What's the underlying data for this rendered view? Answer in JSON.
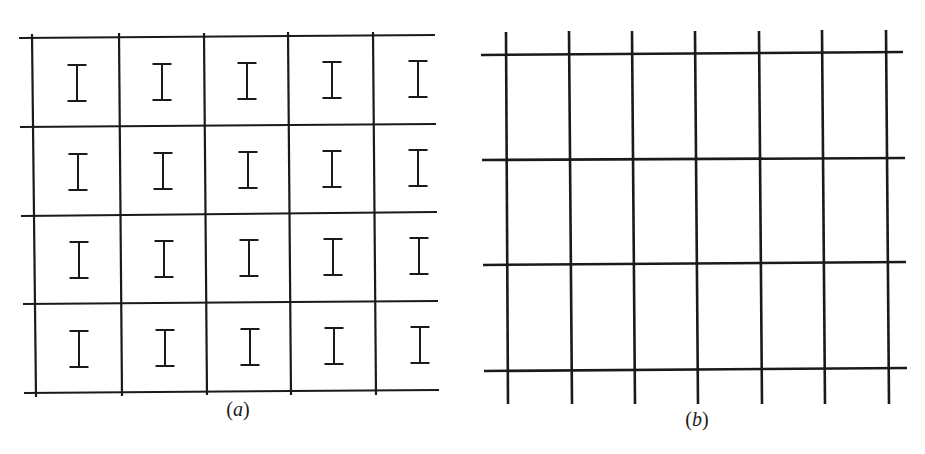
{
  "figure": {
    "line_color": "#1a1a1a",
    "panels": [
      {
        "id": "a",
        "caption": "(a)",
        "caption_letter": "a",
        "description": "Grid of 5 columns x 4 rows of cells, each containing an I-shaped symbol",
        "rows": 4,
        "columns": 5,
        "cell_symbol": "I",
        "h_lines": [
          {
            "x1": 19,
            "y1": 38,
            "x2": 435,
            "y2": 35
          },
          {
            "x1": 20,
            "y1": 127,
            "x2": 436,
            "y2": 124
          },
          {
            "x1": 21,
            "y1": 216,
            "x2": 437,
            "y2": 212
          },
          {
            "x1": 23,
            "y1": 304,
            "x2": 438,
            "y2": 301
          },
          {
            "x1": 24,
            "y1": 393,
            "x2": 439,
            "y2": 390
          }
        ],
        "v_lines": [
          {
            "x1": 32,
            "y1": 34,
            "x2": 36,
            "y2": 397
          },
          {
            "x1": 119,
            "y1": 33,
            "x2": 122,
            "y2": 396
          },
          {
            "x1": 204,
            "y1": 33,
            "x2": 207,
            "y2": 395
          },
          {
            "x1": 288,
            "y1": 32,
            "x2": 291,
            "y2": 395
          },
          {
            "x1": 373,
            "y1": 32,
            "x2": 376,
            "y2": 395
          }
        ],
        "symbol_centers": [
          [
            [
              77,
              83
            ],
            [
              162,
              82
            ],
            [
              247,
              81
            ],
            [
              332,
              80
            ],
            [
              418,
              79
            ]
          ],
          [
            [
              78,
              172
            ],
            [
              163,
              171
            ],
            [
              248,
              170
            ],
            [
              332,
              169
            ],
            [
              418,
              168
            ]
          ],
          [
            [
              79,
              260
            ],
            [
              164,
              259
            ],
            [
              249,
              258
            ],
            [
              333,
              257
            ],
            [
              419,
              256
            ]
          ],
          [
            [
              79,
              349
            ],
            [
              165,
              348
            ],
            [
              250,
              347
            ],
            [
              334,
              346
            ],
            [
              420,
              345
            ]
          ]
        ],
        "caption_pos": {
          "x": 238,
          "y": 398
        }
      },
      {
        "id": "b",
        "caption": "(b)",
        "caption_letter": "b",
        "description": "Plain rectangular grid of 7 vertical lines and 4 horizontal lines",
        "rows": 3,
        "columns": 6,
        "h_lines": [
          {
            "x1": 481,
            "y1": 55,
            "x2": 903,
            "y2": 52
          },
          {
            "x1": 482,
            "y1": 160,
            "x2": 905,
            "y2": 158
          },
          {
            "x1": 483,
            "y1": 265,
            "x2": 906,
            "y2": 262
          },
          {
            "x1": 484,
            "y1": 371,
            "x2": 907,
            "y2": 368
          }
        ],
        "v_lines": [
          {
            "x1": 506,
            "y1": 32,
            "x2": 508,
            "y2": 404
          },
          {
            "x1": 569,
            "y1": 31,
            "x2": 572,
            "y2": 404
          },
          {
            "x1": 632,
            "y1": 31,
            "x2": 635,
            "y2": 404
          },
          {
            "x1": 695,
            "y1": 31,
            "x2": 698,
            "y2": 404
          },
          {
            "x1": 759,
            "y1": 31,
            "x2": 762,
            "y2": 404
          },
          {
            "x1": 822,
            "y1": 30,
            "x2": 825,
            "y2": 404
          },
          {
            "x1": 886,
            "y1": 30,
            "x2": 889,
            "y2": 404
          }
        ],
        "caption_pos": {
          "x": 697,
          "y": 408
        }
      }
    ]
  }
}
